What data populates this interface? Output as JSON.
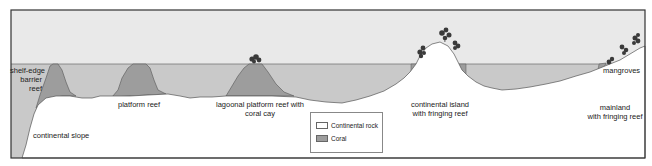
{
  "diagram": {
    "colors": {
      "sky": "#e9e9e9",
      "water": "#c9c9c9",
      "coral": "#9d9d9d",
      "continental_rock": "#ffffff",
      "outline": "#555555",
      "frame": "#333333",
      "vegetation": "#3a3a3a"
    },
    "labels": {
      "shelf_edge_barrier_reef": [
        "shelf-edge",
        "barrier",
        "reef"
      ],
      "continental_slope": "continental slope",
      "platform_reef": "platform reef",
      "lagoonal_platform_reef": [
        "lagoonal platform reef with",
        "coral cay"
      ],
      "continental_island": [
        "continental island",
        "with fringing reef"
      ],
      "mangroves": "mangroves",
      "mainland": [
        "mainland",
        "with fringing reef"
      ]
    },
    "legend": {
      "items": [
        {
          "label": "Continental rock",
          "swatch": "#ffffff"
        },
        {
          "label": "Coral",
          "swatch": "#9d9d9d"
        }
      ]
    }
  }
}
